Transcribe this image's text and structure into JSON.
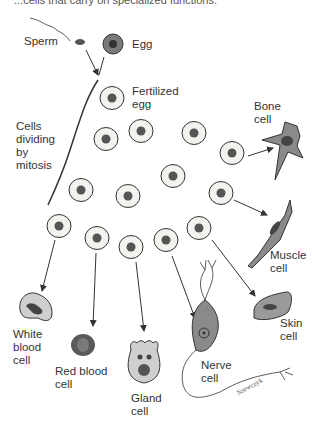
{
  "caption": "...cells that carry on specialized functions.",
  "labels": {
    "sperm": "Sperm",
    "egg": "Egg",
    "fertilized_egg": [
      "Fertilized",
      "egg"
    ],
    "mitosis": [
      "Cells",
      "dividing",
      "by",
      "mitosis"
    ],
    "bone": [
      "Bone",
      "cell"
    ],
    "muscle": [
      "Muscle",
      "cell"
    ],
    "skin": [
      "Skin",
      "cell"
    ],
    "nerve": [
      "Nerve",
      "cell"
    ],
    "gland": [
      "Gland",
      "cell"
    ],
    "red_blood": [
      "Red blood",
      "cell"
    ],
    "white_blood": [
      "White",
      "blood",
      "cell"
    ],
    "signature": "Szewczyk"
  },
  "colors": {
    "line": "#333333",
    "cell_fill": "#f4f2ee",
    "nucleus": "#555555",
    "specialized_fill": "#8a8a8a",
    "red_cell": "#5a5a5a"
  }
}
